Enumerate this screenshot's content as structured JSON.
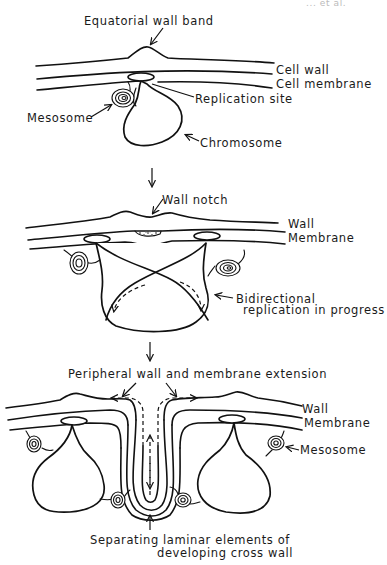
{
  "diagram": {
    "header_fragment": "... et al.",
    "stage1": {
      "labels": {
        "equatorial_wall_band": "Equatorial wall band",
        "cell_wall": "Cell wall",
        "cell_membrane": "Cell membrane",
        "replication_site": "Replication site",
        "mesosome": "Mesosome",
        "chromosome": "Chromosome"
      }
    },
    "stage2": {
      "labels": {
        "wall_notch": "Wall notch",
        "wall": "Wall",
        "membrane": "Membrane",
        "bidirectional_line1": "Bidirectional",
        "bidirectional_line2": "replication in progress"
      }
    },
    "stage3": {
      "labels": {
        "peripheral_extension": "Peripheral wall and membrane extension",
        "wall": "Wall",
        "membrane": "Membrane",
        "mesosome": "Mesosome",
        "separating_line1": "Separating laminar elements of",
        "separating_line2": "developing cross wall"
      }
    },
    "stage_count": 3
  }
}
